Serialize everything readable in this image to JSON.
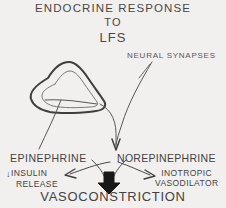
{
  "figure": {
    "background_color": "#f1f0ee",
    "ink_color": "#4a4846",
    "title": {
      "line1": "ENDOCRINE  RESPONSE",
      "line2": "TO",
      "line3": "LFS"
    },
    "labels": {
      "neural_synapses": "NEURAL SYNAPSES",
      "epinephrine": "EPINEPHRINE",
      "norepinephrine": "NOREPINEPHRINE",
      "insulin_release_arrow": "↓",
      "insulin_release_line1": "INSULIN",
      "insulin_release_line2": "RELEASE",
      "inotropic": "INOTROPIC",
      "vasodilator": "VASODILATOR",
      "vasoconstriction": "VASOCONSTRICTION"
    },
    "graphics": {
      "gland_shape": "adrenal-gland-outline",
      "arrow_gland_to_epinephrine": "curve-down-left",
      "arrow_gland_to_norepinephrine": "curve-down-right",
      "arrow_synapses_to_norepinephrine": "curve-down-left",
      "arrow_epinephrine_to_insulin": "curve-left",
      "arrow_norepinephrine_to_inotropic": "curve-right",
      "arrow_to_vasoconstriction": "thick-down-arrow"
    }
  }
}
